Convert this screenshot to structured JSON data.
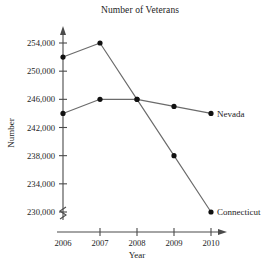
{
  "chart_data": {
    "type": "line",
    "title": "Number of Veterans",
    "xlabel": "Year",
    "ylabel": "Number",
    "x": [
      2006,
      2007,
      2008,
      2009,
      2010
    ],
    "xtick_labels": [
      "2006",
      "2007",
      "2008",
      "2009",
      "2010"
    ],
    "ytick_values": [
      230000,
      234000,
      238000,
      242000,
      246000,
      250000,
      254000
    ],
    "ytick_labels": [
      "230,000",
      "234,000",
      "238,000",
      "242,000",
      "246,000",
      "250,000",
      "254,000"
    ],
    "ylim": [
      230000,
      254000
    ],
    "xlim": [
      2006,
      2010
    ],
    "grid": false,
    "legend_position": "inline-right",
    "y_axis_break": true,
    "series": [
      {
        "name": "Connecticut",
        "label": "Connecticut",
        "color": "#6b6b6b",
        "marker": "circle",
        "values": [
          252000,
          254000,
          246000,
          238000,
          230000
        ]
      },
      {
        "name": "Nevada",
        "label": "Nevada",
        "color": "#6b6b6b",
        "marker": "circle",
        "values": [
          244000,
          246000,
          246000,
          245000,
          244000
        ]
      }
    ]
  },
  "colors": {
    "axis": "#4a4a4a",
    "line": "#6b6b6b",
    "marker": "#111111",
    "text": "#1d1d1d",
    "background": "#ffffff"
  }
}
